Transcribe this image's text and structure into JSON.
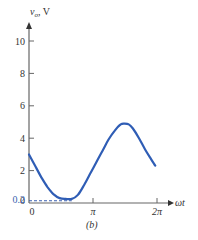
{
  "chart_data": {
    "type": "line",
    "title": "",
    "caption": "(b)",
    "xlabel": "ωt",
    "ylabel": "v_o, V",
    "ylabel_main": "v",
    "ylabel_sub": "o",
    "ylabel_unit": ", V",
    "xlim": [
      0,
      6.2832
    ],
    "ylim": [
      0,
      10.5
    ],
    "x_ticks": [
      {
        "value": 0,
        "label": "0"
      },
      {
        "value": 3.1416,
        "label": "π"
      },
      {
        "value": 6.2832,
        "label": "2π"
      }
    ],
    "y_ticks": [
      {
        "value": 0,
        "label": "0"
      },
      {
        "value": 2,
        "label": "2"
      },
      {
        "value": 4,
        "label": "4"
      },
      {
        "value": 6,
        "label": "6"
      },
      {
        "value": 8,
        "label": "8"
      },
      {
        "value": 10,
        "label": "10"
      }
    ],
    "annotations": [
      {
        "type": "dashed-hline",
        "value": 0.2,
        "label": "0.2",
        "x_end": 2.1
      }
    ],
    "grid": false,
    "legend": null,
    "series": [
      {
        "name": "v_o",
        "color": "#2f5db5",
        "x": [
          0,
          0.3,
          0.6,
          0.9,
          1.2,
          1.5,
          1.8,
          2.1,
          2.4,
          2.7,
          3.0,
          3.3,
          3.6,
          3.9,
          4.2,
          4.5,
          4.7,
          4.9,
          5.1,
          5.4,
          5.7,
          6.0,
          6.2
        ],
        "values": [
          3.0,
          2.3,
          1.6,
          1.0,
          0.55,
          0.3,
          0.25,
          0.25,
          0.5,
          1.1,
          1.8,
          2.5,
          3.2,
          3.9,
          4.45,
          4.85,
          4.9,
          4.85,
          4.6,
          4.0,
          3.3,
          2.7,
          2.3
        ]
      }
    ]
  }
}
